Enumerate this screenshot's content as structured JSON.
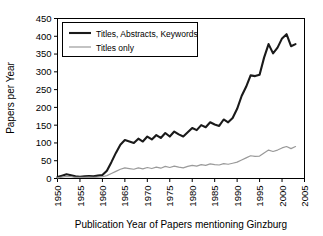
{
  "chart_data": {
    "type": "line",
    "title": "",
    "top_cropped_text": "",
    "xlabel": "Publication Year of Papers mentioning Ginzburg",
    "ylabel": "Papers per Year",
    "xlim": [
      1950,
      2005
    ],
    "ylim": [
      0,
      450
    ],
    "xticks": [
      1950,
      1955,
      1960,
      1965,
      1970,
      1975,
      1980,
      1985,
      1990,
      1995,
      2000,
      2005
    ],
    "yticks": [
      0,
      50,
      100,
      150,
      200,
      250,
      300,
      350,
      400,
      450
    ],
    "xtick_labels": [
      "1950",
      "1955",
      "1960",
      "1965",
      "1970",
      "1975",
      "1980",
      "1985",
      "1990",
      "1995",
      "2000",
      "2005"
    ],
    "ytick_labels": [
      "0",
      "50",
      "100",
      "150",
      "200",
      "250",
      "300",
      "350",
      "400",
      "450"
    ],
    "grid": false,
    "legend_position": "upper-left",
    "x": [
      1950,
      1951,
      1952,
      1953,
      1954,
      1955,
      1956,
      1957,
      1958,
      1959,
      1960,
      1961,
      1962,
      1963,
      1964,
      1965,
      1966,
      1967,
      1968,
      1969,
      1970,
      1971,
      1972,
      1973,
      1974,
      1975,
      1976,
      1977,
      1978,
      1979,
      1980,
      1981,
      1982,
      1983,
      1984,
      1985,
      1986,
      1987,
      1988,
      1989,
      1990,
      1991,
      1992,
      1993,
      1994,
      1995,
      1996,
      1997,
      1998,
      1999,
      2000,
      2001,
      2002,
      2003
    ],
    "series": [
      {
        "name": "Titles, Abstracts, Keywords",
        "color": "#1a1a1a",
        "width": 2.1,
        "values": [
          4,
          8,
          12,
          9,
          6,
          5,
          6,
          7,
          6,
          8,
          10,
          22,
          46,
          72,
          95,
          108,
          104,
          100,
          112,
          104,
          118,
          110,
          122,
          114,
          128,
          118,
          132,
          124,
          118,
          130,
          142,
          136,
          150,
          144,
          158,
          152,
          148,
          166,
          158,
          170,
          196,
          232,
          258,
          290,
          288,
          292,
          340,
          378,
          352,
          368,
          394,
          406,
          372,
          378
        ]
      },
      {
        "name": "Titles only",
        "color": "#9a9a9a",
        "width": 1.2,
        "values": [
          2,
          4,
          6,
          5,
          3,
          3,
          3,
          4,
          3,
          4,
          5,
          8,
          14,
          20,
          26,
          30,
          28,
          26,
          30,
          27,
          31,
          28,
          32,
          29,
          34,
          31,
          35,
          32,
          30,
          34,
          37,
          35,
          39,
          37,
          41,
          39,
          38,
          42,
          40,
          43,
          46,
          52,
          58,
          64,
          62,
          63,
          72,
          80,
          76,
          80,
          86,
          90,
          84,
          90
        ]
      }
    ]
  },
  "legend": {
    "items": [
      {
        "label": "Titles, Abstracts, Keywords"
      },
      {
        "label": "Titles only"
      }
    ]
  }
}
